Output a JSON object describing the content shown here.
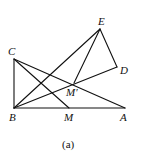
{
  "figure": {
    "caption": "(a)",
    "points": {
      "A": {
        "label": "A",
        "x": 125,
        "y": 108
      },
      "B": {
        "label": "B",
        "x": 14,
        "y": 108
      },
      "C": {
        "label": "C",
        "x": 14,
        "y": 59
      },
      "D": {
        "label": "D",
        "x": 117,
        "y": 67
      },
      "E": {
        "label": "E",
        "x": 100,
        "y": 29
      },
      "M": {
        "label": "M",
        "x": 69,
        "y": 108
      },
      "Mp": {
        "label": "M′",
        "x": 74,
        "y": 83
      }
    },
    "segments": [
      [
        "B",
        "C"
      ],
      [
        "B",
        "A"
      ],
      [
        "C",
        "A"
      ],
      [
        "C",
        "M"
      ],
      [
        "B",
        "E"
      ],
      [
        "B",
        "D"
      ],
      [
        "E",
        "D"
      ],
      [
        "E",
        "Mp"
      ]
    ],
    "stroke_color": "#111111"
  }
}
